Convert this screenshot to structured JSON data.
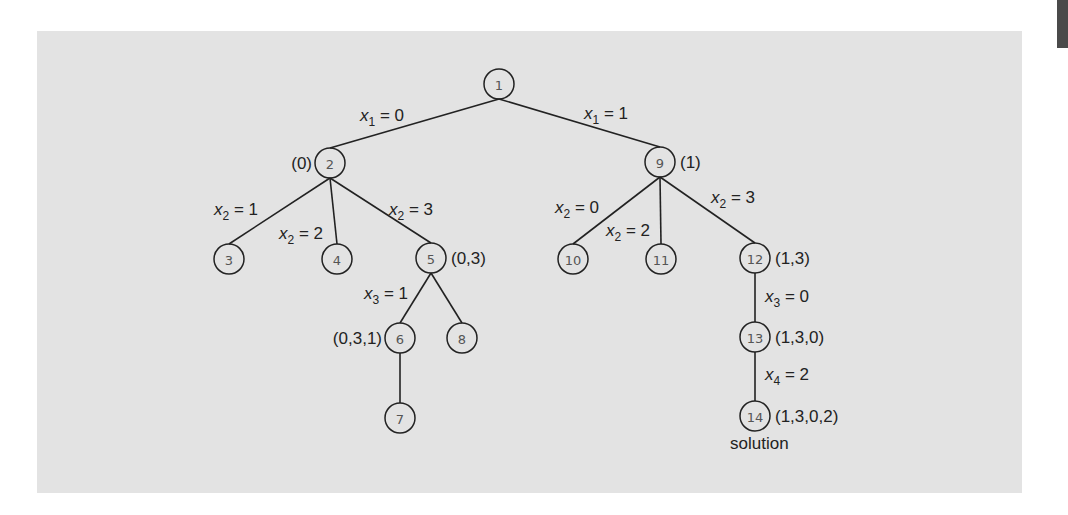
{
  "diagram": {
    "colors": {
      "panel": "#e3e3e3",
      "ink": "#222222",
      "node_text": "#555555",
      "corner_tab": "#4a4a4a"
    },
    "nodes": [
      {
        "id": "1",
        "label": "1",
        "x": 499,
        "y": 84
      },
      {
        "id": "2",
        "label": "2",
        "x": 330,
        "y": 163,
        "state": "(0)",
        "state_side": "left"
      },
      {
        "id": "9",
        "label": "9",
        "x": 660,
        "y": 162,
        "state": "(1)",
        "state_side": "right"
      },
      {
        "id": "3",
        "label": "3",
        "x": 229,
        "y": 259
      },
      {
        "id": "4",
        "label": "4",
        "x": 337,
        "y": 259
      },
      {
        "id": "5",
        "label": "5",
        "x": 431,
        "y": 258,
        "state": "(0,3)",
        "state_side": "right"
      },
      {
        "id": "10",
        "label": "10",
        "x": 573,
        "y": 259
      },
      {
        "id": "11",
        "label": "11",
        "x": 661,
        "y": 259
      },
      {
        "id": "12",
        "label": "12",
        "x": 755,
        "y": 258,
        "state": "(1,3)",
        "state_side": "right"
      },
      {
        "id": "6",
        "label": "6",
        "x": 400,
        "y": 338,
        "state": "(0,3,1)",
        "state_side": "left"
      },
      {
        "id": "8",
        "label": "8",
        "x": 462,
        "y": 338
      },
      {
        "id": "7",
        "label": "7",
        "x": 400,
        "y": 418
      },
      {
        "id": "13",
        "label": "13",
        "x": 755,
        "y": 337,
        "state": "(1,3,0)",
        "state_side": "right"
      },
      {
        "id": "14",
        "label": "14",
        "x": 755,
        "y": 416,
        "state": "(1,3,0,2)",
        "state_side": "right"
      }
    ],
    "edges": [
      {
        "from": "1",
        "to": "2",
        "var": "x",
        "sub": "1",
        "value": "0",
        "lx": 360,
        "ly": 121
      },
      {
        "from": "1",
        "to": "9",
        "var": "x",
        "sub": "1",
        "value": "1",
        "lx": 584,
        "ly": 119
      },
      {
        "from": "2",
        "to": "3",
        "var": "x",
        "sub": "2",
        "value": "1",
        "lx": 214,
        "ly": 215
      },
      {
        "from": "2",
        "to": "4",
        "var": "x",
        "sub": "2",
        "value": "2",
        "lx": 279,
        "ly": 239
      },
      {
        "from": "2",
        "to": "5",
        "var": "x",
        "sub": "2",
        "value": "3",
        "lx": 389,
        "ly": 215
      },
      {
        "from": "9",
        "to": "10",
        "var": "x",
        "sub": "2",
        "value": "0",
        "lx": 555,
        "ly": 213
      },
      {
        "from": "9",
        "to": "11",
        "var": "x",
        "sub": "2",
        "value": "2",
        "lx": 606,
        "ly": 236
      },
      {
        "from": "9",
        "to": "12",
        "var": "x",
        "sub": "2",
        "value": "3",
        "lx": 711,
        "ly": 203
      },
      {
        "from": "5",
        "to": "6",
        "var": "x",
        "sub": "3",
        "value": "1",
        "lx": 364,
        "ly": 299
      },
      {
        "from": "5",
        "to": "8"
      },
      {
        "from": "6",
        "to": "7"
      },
      {
        "from": "12",
        "to": "13",
        "var": "x",
        "sub": "3",
        "value": "0",
        "lx": 765,
        "ly": 302
      },
      {
        "from": "13",
        "to": "14",
        "var": "x",
        "sub": "4",
        "value": "2",
        "lx": 765,
        "ly": 380
      }
    ],
    "annotations": [
      {
        "text": "solution",
        "x": 730,
        "y": 449
      }
    ]
  }
}
